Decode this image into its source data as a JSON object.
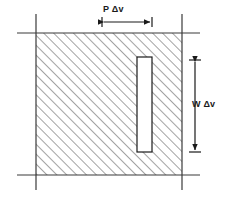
{
  "figure": {
    "title": "",
    "kind": "engineering-dimension-diagram",
    "colors": {
      "stroke": "#1a1a1a",
      "hatch": "#555555",
      "background": "#ffffff",
      "inner_fill": "#ffffff"
    },
    "hatched_region": {
      "name": "hatched-square",
      "x": 36,
      "y": 33,
      "width": 146,
      "height": 142,
      "hatch_angle_degrees": 45,
      "hatch_spacing_px": 7
    },
    "inner_rectangle": {
      "name": "inner-white-rectangle",
      "x": 137,
      "y": 57,
      "width": 15,
      "height": 95
    },
    "axis_lines": {
      "horizontal": [
        {
          "name": "top-horizontal-line",
          "x1": 17,
          "y1": 33,
          "x2": 200,
          "y2": 33
        },
        {
          "name": "bottom-horizontal-line",
          "x1": 17,
          "y1": 175,
          "x2": 200,
          "y2": 175
        }
      ],
      "vertical": [
        {
          "name": "left-vertical-line",
          "x1": 36,
          "y1": 14,
          "x2": 36,
          "y2": 190
        },
        {
          "name": "right-vertical-line",
          "x1": 182,
          "y1": 14,
          "x2": 182,
          "y2": 190
        }
      ]
    },
    "dimensions": [
      {
        "id": "horizontal_dimension",
        "label": "P Δv",
        "orientation": "horizontal",
        "axis_y": 22,
        "start": 102,
        "end": 152,
        "tick_half_height": 5,
        "label_x": 103,
        "label_y": 5
      },
      {
        "id": "vertical_dimension",
        "label": "W Δv",
        "orientation": "vertical",
        "axis_x": 195,
        "start": 60,
        "end": 152,
        "tick_half_width": 6,
        "label_x": 192,
        "label_y": 100
      }
    ]
  }
}
